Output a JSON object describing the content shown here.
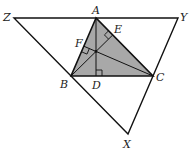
{
  "diagram": {
    "colors": {
      "line": "#111111",
      "fill": "#a8a8a8",
      "background": "#ffffff"
    },
    "points": {
      "A": [
        96,
        18
      ],
      "B": [
        71,
        76
      ],
      "C": [
        153,
        76
      ],
      "X": [
        128,
        134
      ],
      "Y": [
        178,
        18
      ],
      "Z": [
        14,
        18
      ],
      "D": [
        96,
        76
      ],
      "E": [
        112.7,
        35
      ],
      "F": [
        83.8,
        46.2
      ],
      "H": [
        96,
        51.4
      ]
    },
    "labels": {
      "A": "A",
      "B": "B",
      "C": "C",
      "D": "D",
      "E": "E",
      "F": "F",
      "X": "X",
      "Y": "Y",
      "Z": "Z"
    },
    "right_angles": [
      "D",
      "E",
      "F"
    ]
  }
}
